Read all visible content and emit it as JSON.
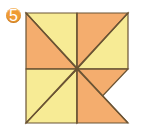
{
  "page": {
    "background_color": "#ffffff",
    "width": 145,
    "height": 132
  },
  "badge": {
    "name": "exercise-number-badge",
    "number": "5",
    "fill_color": "#ef9b33",
    "text_color": "#ffffff"
  },
  "figure": {
    "stroke_color": "#6b5434",
    "stroke_width": 1.2,
    "colors": {
      "light": "#f7eb95",
      "dark": "#f4ad6e",
      "empty": "#ffffff"
    },
    "bounds": {
      "left": 26,
      "top": 13,
      "right": 128,
      "bottom": 123,
      "center_x": 77,
      "center_y": 69
    },
    "blades": [
      {
        "id": "blade-top-left-light",
        "color_key": "light",
        "points": "26,13 77,13 77,69"
      },
      {
        "id": "blade-top-left-dark",
        "color_key": "dark",
        "points": "26,13 77,69 26,69"
      },
      {
        "id": "blade-top-right-dark",
        "color_key": "dark",
        "points": "77,13 128,13 77,69"
      },
      {
        "id": "blade-top-right-light",
        "color_key": "light",
        "points": "128,13 128,69 77,69"
      },
      {
        "id": "blade-bottom-right-dark",
        "color_key": "dark",
        "points": "77,69 128,69 77,123"
      },
      {
        "id": "blade-bottom-right-light",
        "color_key": "light",
        "points": "77,69 77,123 26,123"
      },
      {
        "id": "blade-bottom-left-light",
        "color_key": "light",
        "points": "26,69 77,69 26,123"
      },
      {
        "id": "blade-bottom-left-dark",
        "color_key": "dark",
        "points": "77,69 128,123 77,123"
      }
    ],
    "guide_lines": [
      {
        "id": "diagonal-main",
        "x1": 26,
        "y1": 13,
        "x2": 128,
        "y2": 123
      },
      {
        "id": "diagonal-anti",
        "x1": 128,
        "y1": 13,
        "x2": 26,
        "y2": 123
      },
      {
        "id": "axis-horizontal",
        "x1": 26,
        "y1": 69,
        "x2": 128,
        "y2": 69
      },
      {
        "id": "axis-vertical",
        "x1": 77,
        "y1": 13,
        "x2": 77,
        "y2": 123
      }
    ]
  }
}
